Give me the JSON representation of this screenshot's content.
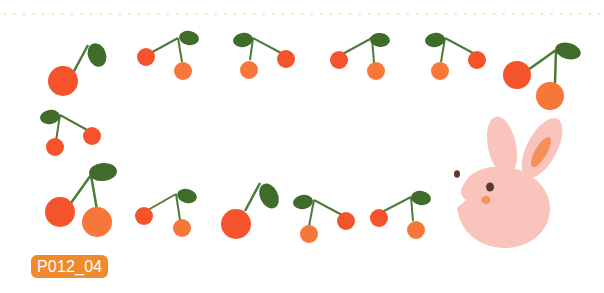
{
  "image": {
    "description": "Decorative cherry frame with pink bunny",
    "code_label": "P012_04"
  },
  "colors": {
    "cherry_red": "#f4532c",
    "cherry_orange": "#f7763a",
    "leaf": "#3f6b2b",
    "stem": "#4e7a3a",
    "bunny": "#f8c4bc",
    "bunny_inner_ear": "#f4915a",
    "bunny_eye": "#5a3a2a",
    "bunny_cheek": "#f4905f",
    "badge": "#f08a2c",
    "dots": "#f2e3a6"
  }
}
